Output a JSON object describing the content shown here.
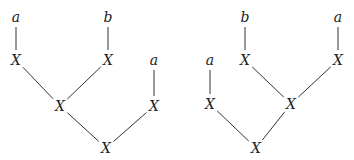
{
  "diagram": {
    "type": "tree-pair",
    "trees": [
      {
        "name": "left-tree",
        "nodes": [
          {
            "id": "a1",
            "label": "a",
            "x": 16,
            "y": 17
          },
          {
            "id": "x1",
            "label": "X",
            "x": 16,
            "y": 60
          },
          {
            "id": "b1",
            "label": "b",
            "x": 108,
            "y": 17
          },
          {
            "id": "x2",
            "label": "X",
            "x": 108,
            "y": 60
          },
          {
            "id": "a2",
            "label": "a",
            "x": 154,
            "y": 60
          },
          {
            "id": "x3",
            "label": "X",
            "x": 154,
            "y": 106
          },
          {
            "id": "x4",
            "label": "X",
            "x": 60,
            "y": 106
          },
          {
            "id": "x5",
            "label": "X",
            "x": 106,
            "y": 148
          }
        ],
        "edges": [
          [
            "a1",
            "x1"
          ],
          [
            "b1",
            "x2"
          ],
          [
            "a2",
            "x3"
          ],
          [
            "x1",
            "x4"
          ],
          [
            "x2",
            "x4"
          ],
          [
            "x4",
            "x5"
          ],
          [
            "x3",
            "x5"
          ]
        ]
      },
      {
        "name": "right-tree",
        "nodes": [
          {
            "id": "b1",
            "label": "b",
            "x": 245,
            "y": 17
          },
          {
            "id": "x1",
            "label": "X",
            "x": 245,
            "y": 60
          },
          {
            "id": "a1",
            "label": "a",
            "x": 338,
            "y": 17
          },
          {
            "id": "x2",
            "label": "X",
            "x": 338,
            "y": 60
          },
          {
            "id": "a2",
            "label": "a",
            "x": 210,
            "y": 60
          },
          {
            "id": "x3",
            "label": "X",
            "x": 210,
            "y": 104
          },
          {
            "id": "x4",
            "label": "X",
            "x": 291,
            "y": 104
          },
          {
            "id": "x5",
            "label": "X",
            "x": 256,
            "y": 148
          }
        ],
        "edges": [
          [
            "b1",
            "x1"
          ],
          [
            "a1",
            "x2"
          ],
          [
            "a2",
            "x3"
          ],
          [
            "x1",
            "x4"
          ],
          [
            "x2",
            "x4"
          ],
          [
            "x3",
            "x5"
          ],
          [
            "x4",
            "x5"
          ]
        ]
      }
    ]
  }
}
